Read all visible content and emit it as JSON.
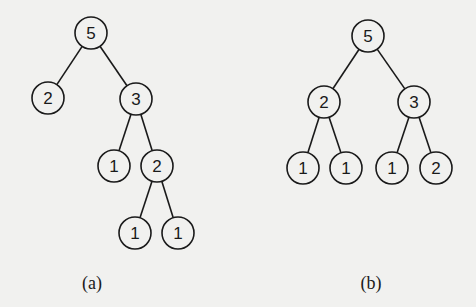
{
  "figure": {
    "background": "#f1f1ef",
    "stroke_color": "#1a1a1a",
    "node_radius": 16,
    "trees": [
      {
        "id": "a",
        "caption": "(a)",
        "caption_pos": [
          92,
          283
        ],
        "nodes": [
          {
            "id": "a0",
            "label": "5",
            "x": 91,
            "y": 33
          },
          {
            "id": "a1",
            "label": "2",
            "x": 48,
            "y": 98
          },
          {
            "id": "a2",
            "label": "3",
            "x": 136,
            "y": 99
          },
          {
            "id": "a3",
            "label": "1",
            "x": 114,
            "y": 166
          },
          {
            "id": "a4",
            "label": "2",
            "x": 157,
            "y": 166
          },
          {
            "id": "a5",
            "label": "1",
            "x": 135,
            "y": 233
          },
          {
            "id": "a6",
            "label": "1",
            "x": 178,
            "y": 233
          }
        ],
        "edges": [
          [
            "a0",
            "a1"
          ],
          [
            "a0",
            "a2"
          ],
          [
            "a2",
            "a3"
          ],
          [
            "a2",
            "a4"
          ],
          [
            "a4",
            "a5"
          ],
          [
            "a4",
            "a6"
          ]
        ]
      },
      {
        "id": "b",
        "caption": "(b)",
        "caption_pos": [
          371,
          283
        ],
        "nodes": [
          {
            "id": "b0",
            "label": "5",
            "x": 368,
            "y": 36
          },
          {
            "id": "b1",
            "label": "2",
            "x": 324,
            "y": 102
          },
          {
            "id": "b2",
            "label": "3",
            "x": 414,
            "y": 102
          },
          {
            "id": "b3",
            "label": "1",
            "x": 303,
            "y": 168
          },
          {
            "id": "b4",
            "label": "1",
            "x": 346,
            "y": 168
          },
          {
            "id": "b5",
            "label": "1",
            "x": 392,
            "y": 168
          },
          {
            "id": "b6",
            "label": "2",
            "x": 436,
            "y": 168
          }
        ],
        "edges": [
          [
            "b0",
            "b1"
          ],
          [
            "b0",
            "b2"
          ],
          [
            "b1",
            "b3"
          ],
          [
            "b1",
            "b4"
          ],
          [
            "b2",
            "b5"
          ],
          [
            "b2",
            "b6"
          ]
        ]
      }
    ]
  }
}
